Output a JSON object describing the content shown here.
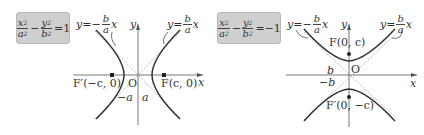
{
  "left": {
    "equation": {
      "x_num": "x",
      "x_den": "a",
      "minus": "−",
      "y_num": "y",
      "y_den": "b",
      "rhs": "=1"
    },
    "asymptote_neg": {
      "prefix": "y=−",
      "num": "b",
      "den": "a",
      "suffix": "x"
    },
    "asymptote_pos": {
      "prefix": "y=",
      "num": "b",
      "den": "a",
      "suffix": "x"
    },
    "axis_y": "y",
    "axis_x": "x",
    "origin": "O",
    "focus_left": "F′(−c, 0)",
    "focus_right": "F(c, 0)",
    "vertex_left": "−a",
    "vertex_right": "a"
  },
  "right": {
    "equation": {
      "x_num": "x",
      "x_den": "a",
      "minus": "−",
      "y_num": "y",
      "y_den": "b",
      "rhs": "=−1"
    },
    "asymptote_neg": {
      "prefix": "y=−",
      "num": "b",
      "den": "a",
      "suffix": "x"
    },
    "asymptote_pos": {
      "prefix": "y=",
      "num": "b",
      "den": "a",
      "suffix": "x"
    },
    "axis_y": "y",
    "axis_x": "x",
    "origin": "O",
    "focus_top": "F(0, c)",
    "focus_bottom": "F′(0, −c)",
    "vertex_top": "b",
    "vertex_bottom": "−b"
  },
  "colors": {
    "box": "#cfcfcf",
    "curve": "#333333",
    "asymptote": "#999999"
  }
}
